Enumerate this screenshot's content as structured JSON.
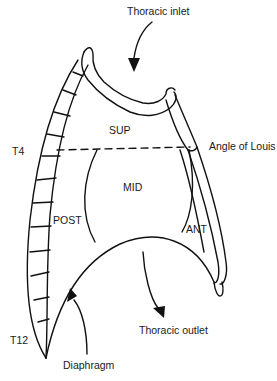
{
  "diagram": {
    "type": "anatomical-line-drawing",
    "labels": {
      "thoracic_inlet": "Thoracic inlet",
      "sup": "SUP",
      "t4": "T4",
      "angle_of_louis": "Angle of Louis",
      "mid": "MID",
      "post": "POST",
      "ant": "ANT",
      "t12": "T12",
      "thoracic_outlet": "Thoracic outlet",
      "diaphragm": "Diaphragm"
    },
    "arrows": [
      {
        "name": "thoracic-inlet-arrow",
        "direction": "down"
      },
      {
        "name": "thoracic-outlet-arrow",
        "direction": "down"
      },
      {
        "name": "diaphragm-arrow",
        "direction": "up"
      }
    ],
    "divider": {
      "style": "dashed",
      "from": "T4",
      "to": "Angle of Louis"
    },
    "colors": {
      "line": "#111111",
      "background": "#ffffff",
      "text": "#1a1a1a"
    }
  }
}
